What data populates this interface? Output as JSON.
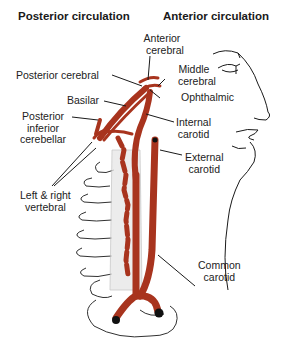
{
  "headers": {
    "posterior": "Posterior circulation",
    "anterior": "Anterior circulation"
  },
  "labels": {
    "anterior_cerebral": [
      "Anterior",
      "cerebral"
    ],
    "middle_cerebral": [
      "Middle",
      "cerebral"
    ],
    "posterior_cerebral": "Posterior cerebral",
    "ophthalmic": "Ophthalmic",
    "basilar": "Basilar",
    "internal_carotid": [
      "Internal",
      "carotid"
    ],
    "posterior_inferior_cerebellar": [
      "Posterior",
      "inferior",
      "cerebellar"
    ],
    "external_carotid": [
      "External",
      "carotid"
    ],
    "left_right_vertebral": [
      "Left & right",
      "vertebral"
    ],
    "common_carotid": [
      "Common",
      "carotid"
    ]
  },
  "colors": {
    "vessel": "#a8341e",
    "outline": "#1a1a1a",
    "spine": "#c9c9c9"
  }
}
